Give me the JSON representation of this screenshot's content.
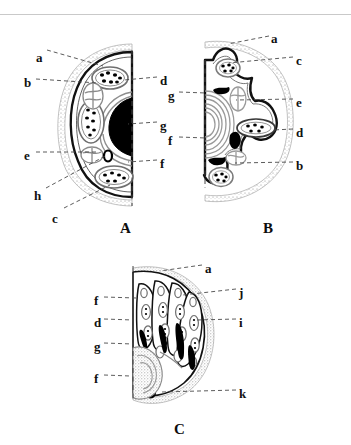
{
  "figure": {
    "title_visible": false,
    "background_color": "#ffffff",
    "ink_color": "#111111",
    "stipple_color": "#9a9a9a",
    "panels": [
      {
        "id": "A",
        "letter": "A",
        "letter_x": 120,
        "letter_y": 221,
        "shape": "half-round cross-section, flat on right, convex on left",
        "labels": [
          {
            "key": "a",
            "x": 36,
            "y": 51,
            "side": "left",
            "tip_x": 103,
            "tip_y": 66
          },
          {
            "key": "b",
            "x": 24,
            "y": 76,
            "side": "left",
            "tip_x": 98,
            "tip_y": 83
          },
          {
            "key": "e",
            "x": 24,
            "y": 149,
            "side": "left",
            "tip_x": 97,
            "tip_y": 152
          },
          {
            "key": "h",
            "x": 34,
            "y": 189,
            "side": "left",
            "tip_x": 107,
            "tip_y": 155
          },
          {
            "key": "c",
            "x": 52,
            "y": 212,
            "side": "left",
            "tip_x": 110,
            "tip_y": 185
          },
          {
            "key": "d",
            "x": 160,
            "y": 74,
            "side": "right",
            "tip_x": 124,
            "tip_y": 80
          },
          {
            "key": "g",
            "x": 160,
            "y": 119,
            "side": "right",
            "tip_x": 128,
            "tip_y": 124
          },
          {
            "key": "f",
            "x": 160,
            "y": 157,
            "side": "right",
            "tip_x": 128,
            "tip_y": 162
          }
        ]
      },
      {
        "id": "B",
        "letter": "B",
        "letter_x": 263,
        "letter_y": 221,
        "shape": "lobed star-shaped cross-section with flat left edge",
        "labels": [
          {
            "key": "a",
            "x": 271,
            "y": 32,
            "side": "right",
            "tip_x": 228,
            "tip_y": 44
          },
          {
            "key": "c",
            "x": 296,
            "y": 54,
            "side": "right",
            "tip_x": 229,
            "tip_y": 63
          },
          {
            "key": "e",
            "x": 296,
            "y": 96,
            "side": "right",
            "tip_x": 236,
            "tip_y": 100
          },
          {
            "key": "d",
            "x": 296,
            "y": 126,
            "side": "right",
            "tip_x": 273,
            "tip_y": 130
          },
          {
            "key": "b",
            "x": 296,
            "y": 159,
            "side": "right",
            "tip_x": 235,
            "tip_y": 163
          },
          {
            "key": "g",
            "x": 168,
            "y": 89,
            "side": "left",
            "tip_x": 206,
            "tip_y": 93
          },
          {
            "key": "f",
            "x": 168,
            "y": 134,
            "side": "left",
            "tip_x": 206,
            "tip_y": 138
          }
        ]
      },
      {
        "id": "C",
        "letter": "C",
        "letter_x": 174,
        "letter_y": 422,
        "shape": "fan of finger-like lobes, flat left edge",
        "labels": [
          {
            "key": "a",
            "x": 205,
            "y": 262,
            "side": "right",
            "tip_x": 160,
            "tip_y": 271
          },
          {
            "key": "j",
            "x": 239,
            "y": 286,
            "side": "right",
            "tip_x": 183,
            "tip_y": 295
          },
          {
            "key": "i",
            "x": 239,
            "y": 316,
            "side": "right",
            "tip_x": 197,
            "tip_y": 320
          },
          {
            "key": "k",
            "x": 239,
            "y": 387,
            "side": "right",
            "tip_x": 162,
            "tip_y": 392
          },
          {
            "key": "f",
            "x": 94,
            "y": 294,
            "side": "left",
            "tip_x": 136,
            "tip_y": 298
          },
          {
            "key": "d",
            "x": 94,
            "y": 316,
            "side": "left",
            "tip_x": 133,
            "tip_y": 320
          },
          {
            "key": "g",
            "x": 94,
            "y": 340,
            "side": "left",
            "tip_x": 133,
            "tip_y": 344
          },
          {
            "key": "f",
            "x": 94,
            "y": 372,
            "side": "left",
            "tip_x": 130,
            "tip_y": 376
          }
        ]
      }
    ]
  }
}
